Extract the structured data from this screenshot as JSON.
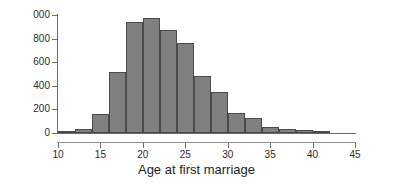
{
  "chart_data": {
    "type": "bar",
    "title": "",
    "subtitle": "",
    "xlabel": "Age at first marriage",
    "ylabel": "",
    "xlim": [
      10,
      45
    ],
    "ylim": [
      0,
      1000
    ],
    "grid": false,
    "legend": null,
    "bin_width": 2,
    "x_tick_labels": [
      "10",
      "15",
      "20",
      "25",
      "30",
      "35",
      "40",
      "45"
    ],
    "x_ticks": [
      10,
      15,
      20,
      25,
      30,
      35,
      40,
      45
    ],
    "y_tick_labels": [
      "0",
      "200",
      "400",
      "600",
      "800",
      "000"
    ],
    "y_ticks": [
      0,
      200,
      400,
      600,
      800,
      1000
    ],
    "bin_edges": [
      10,
      12,
      14,
      16,
      18,
      20,
      22,
      24,
      26,
      28,
      30,
      32,
      34,
      36,
      38,
      40,
      42
    ],
    "categories": [
      "10-12",
      "12-14",
      "14-16",
      "16-18",
      "18-20",
      "20-22",
      "22-24",
      "24-26",
      "26-28",
      "28-30",
      "30-32",
      "32-34",
      "34-36",
      "36-38",
      "38-40",
      "40-42"
    ],
    "values": [
      5,
      30,
      160,
      520,
      940,
      975,
      870,
      760,
      485,
      345,
      170,
      125,
      55,
      35,
      25,
      10
    ],
    "bar_color": "#808080",
    "bar_edge_color": "#4a4a4a",
    "axis_color": "#6b6b6b",
    "text_color": "#2b2b2b"
  },
  "axis": {
    "x_title": "Age at first marriage"
  }
}
